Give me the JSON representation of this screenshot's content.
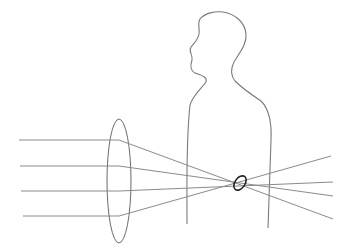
{
  "diagram": {
    "title": "",
    "elements": {
      "human_silhouette": {
        "label": "",
        "shape": "profile-head-and-torso"
      },
      "lens": {
        "label": "",
        "shape": "ellipse",
        "center": [
          119,
          181
        ],
        "rx": 12,
        "ry": 62
      },
      "focal_point": {
        "label": "",
        "shape": "small-ellipse",
        "center": [
          240,
          183
        ]
      },
      "incoming_rays": [
        {
          "y": 140,
          "x_start": 19
        },
        {
          "y": 166,
          "x_start": 20
        },
        {
          "y": 191,
          "x_start": 21
        },
        {
          "y": 216,
          "x_start": 23
        }
      ],
      "outgoing_rays_end": [
        [
          331,
          156
        ],
        [
          333,
          182
        ],
        [
          333,
          196
        ],
        [
          333,
          219
        ]
      ]
    },
    "colors": {
      "ray": "#8a8a8a",
      "outline": "#7a7a7a",
      "focal_point": "#222222",
      "background": "#ffffff"
    }
  }
}
